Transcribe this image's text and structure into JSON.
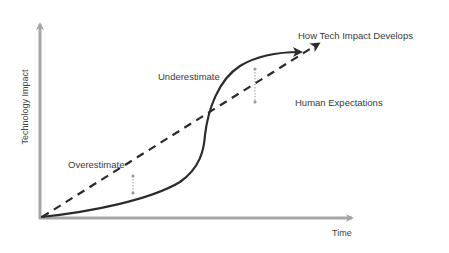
{
  "diagram": {
    "type": "conceptual-curve-diagram",
    "axes": {
      "y_label": "Technology Impact",
      "x_label": "Time",
      "color": "#a6a6a6"
    },
    "series": [
      {
        "name": "How Tech Impact Develops",
        "style": "solid",
        "shape": "s-curve",
        "color": "#2b2b2b"
      },
      {
        "name": "Human Expectations",
        "style": "dashed",
        "shape": "linear",
        "color": "#2b2b2b"
      }
    ],
    "annotations": [
      {
        "label": "Overestimate",
        "region": "early",
        "marker": "dotted double-arrow between expectation line (above) and actual curve (below)"
      },
      {
        "label": "Underestimate",
        "region": "late",
        "marker": "dotted double-arrow between actual curve (above) and expectation line (below)"
      }
    ],
    "marker_color": "#9a9a9a"
  }
}
